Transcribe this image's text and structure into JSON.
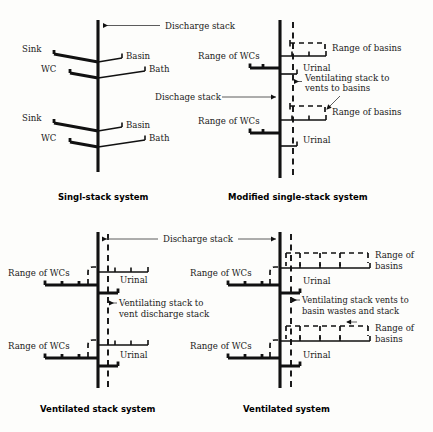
{
  "figure": {
    "kind": "technical-diagram",
    "panel_count": 4
  },
  "panels": [
    {
      "id": "single-stack",
      "title": "Singl-stack system",
      "position": "top-left",
      "stack_type": "discharge-only",
      "has_vent_stack": false,
      "labels": {
        "discharge_stack": "Discharge stack",
        "left_upper": "Sink",
        "left_lower": "WC",
        "right_upper": "Basin",
        "right_lower": "Bath"
      },
      "floors": [
        {
          "appliances_left": [
            "Sink",
            "WC"
          ],
          "appliances_right": [
            "Basin",
            "Bath"
          ]
        },
        {
          "appliances_left": [
            "Sink",
            "WC"
          ],
          "appliances_right": [
            "Basin",
            "Bath"
          ]
        }
      ]
    },
    {
      "id": "modified-single-stack",
      "title": "Modified single-stack system",
      "position": "top-right",
      "stack_type": "discharge-plus-partial-vent",
      "has_vent_stack": true,
      "labels": {
        "discharge_stack": "Dischage stack",
        "range_of_wcs": "Range of WCs",
        "range_of_basins": "Range of basins",
        "urinal": "Urinal",
        "vent_note_line1": "Ventilating stack to",
        "vent_note_line2": "vents to basins"
      },
      "floors": [
        {
          "range_wcs": "Range of WCs",
          "range_basins": "Range of basins",
          "urinal": "Urinal"
        },
        {
          "range_wcs": "Range of WCs",
          "range_basins": "Range of basins",
          "urinal": "Urinal"
        }
      ]
    },
    {
      "id": "ventilated-stack",
      "title": "Ventilated stack system",
      "position": "bottom-left",
      "stack_type": "discharge-plus-full-vent",
      "has_vent_stack": true,
      "labels": {
        "discharge_stack": "Discharge stack",
        "range_of_wcs": "Range of WCs",
        "urinal": "Urinal",
        "vent_note_line1": "Ventilating stack to",
        "vent_note_line2": "vent discharge stack"
      },
      "floors": [
        {
          "range_wcs": "Range of WCs",
          "urinal": "Urinal"
        },
        {
          "range_wcs": "Range of WCs",
          "urinal": "Urinal"
        }
      ]
    },
    {
      "id": "ventilated-system",
      "title": "Ventilated system",
      "position": "bottom-right",
      "stack_type": "fully-vented",
      "has_vent_stack": true,
      "labels": {
        "range_of_wcs": "Range of WCs",
        "range_of_basins_line1": "Range of",
        "range_of_basins_line2": "basins",
        "urinal": "Urinal",
        "vent_note_line1": "Ventilating stack vents to",
        "vent_note_line2": "basin wastes and stack"
      },
      "floors": [
        {
          "range_wcs": "Range of WCs",
          "range_basins": "Range of basins",
          "urinal": "Urinal"
        },
        {
          "range_wcs": "Range of WCs",
          "range_basins": "Range of basins",
          "urinal": "Urinal"
        }
      ]
    }
  ],
  "legend": {
    "solid_line_meaning": "discharge / waste pipework",
    "dashed_line_meaning": "ventilating (vent) pipework"
  },
  "colors": {
    "ink": "#111111",
    "lead_line": "#4a4a4a",
    "background": "#fdfdfb"
  }
}
